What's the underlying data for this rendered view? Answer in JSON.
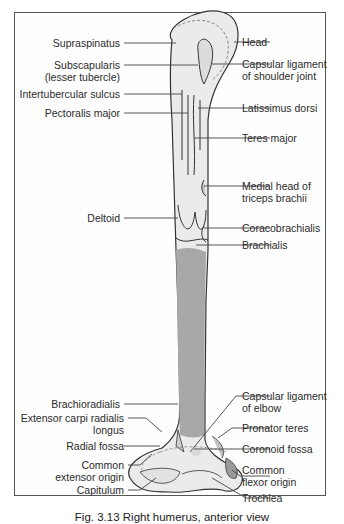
{
  "figure": {
    "caption": "Fig. 3.13  Right humerus, anterior view",
    "colors": {
      "bone": "#e8e8e8",
      "bone_outline": "#333333",
      "shaft_shade": "#a8a8a8",
      "frame": "#555555"
    }
  },
  "labels_left": [
    {
      "text": "Supraspinatus"
    },
    {
      "text": "Subscapularis"
    },
    {
      "text": "(lesser tubercle)"
    },
    {
      "text": "Intertubercular sulcus"
    },
    {
      "text": "Pectoralis major"
    },
    {
      "text": "Deltoid"
    },
    {
      "text": "Brachioradialis"
    },
    {
      "text": "Extensor carpi radialis"
    },
    {
      "text": "longus"
    },
    {
      "text": "Radial fossa"
    },
    {
      "text": "Common"
    },
    {
      "text": "extensor origin"
    },
    {
      "text": "Capitulum"
    }
  ],
  "labels_right": [
    {
      "text": "Head"
    },
    {
      "text": "Capsular ligament"
    },
    {
      "text": "of shoulder joint"
    },
    {
      "text": "Latissimus dorsi"
    },
    {
      "text": "Teres major"
    },
    {
      "text": "Medial head of"
    },
    {
      "text": "triceps brachii"
    },
    {
      "text": "Coracobrachialis"
    },
    {
      "text": "Brachialis"
    },
    {
      "text": "Capsular ligament"
    },
    {
      "text": "of elbow"
    },
    {
      "text": "Pronator teres"
    },
    {
      "text": "Coronoid fossa"
    },
    {
      "text": "Common"
    },
    {
      "text": "flexor origin"
    },
    {
      "text": "Trochlea"
    }
  ]
}
